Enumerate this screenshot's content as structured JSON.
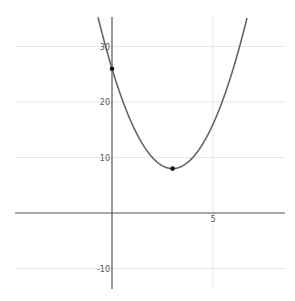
{
  "chart_data": {
    "type": "line",
    "title": "",
    "xlabel": "",
    "ylabel": "",
    "function": "y = 2(x-3)^2 + 8",
    "xlim": [
      -4.8,
      8.6
    ],
    "ylim": [
      -13.5,
      35.5
    ],
    "grid": true,
    "x_ticks": [
      {
        "value": 5,
        "label": "5"
      }
    ],
    "y_ticks": [
      {
        "value": 30,
        "label": "30"
      },
      {
        "value": 20,
        "label": "20"
      },
      {
        "value": 10,
        "label": "10"
      },
      {
        "value": -10,
        "label": "-10"
      }
    ],
    "series": [
      {
        "name": "parabola",
        "x": [
          -0.75,
          0,
          1,
          2,
          3,
          4,
          5,
          6,
          6.75
        ],
        "y": [
          36.1,
          26,
          16,
          10,
          8,
          10,
          16,
          26,
          36.1
        ]
      }
    ],
    "points": [
      {
        "name": "y-intercept",
        "x": 0,
        "y": 26
      },
      {
        "name": "vertex",
        "x": 3,
        "y": 8
      }
    ],
    "colors": {
      "curve": "#666666",
      "axis": "#555555",
      "grid": "#e6e6e6",
      "point": "#111111"
    }
  }
}
